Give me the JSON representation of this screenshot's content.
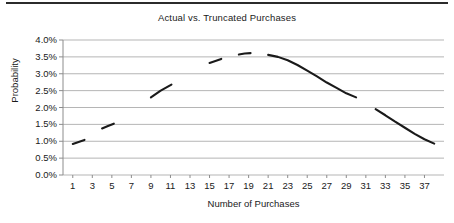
{
  "chart_data": {
    "type": "line",
    "title": "Actual vs. Truncated Purchases",
    "xlabel": "Number of Purchases",
    "ylabel": "Probability",
    "grid": true,
    "legend": "none",
    "xlim": [
      0,
      39
    ],
    "ylim": [
      0.0,
      4.0
    ],
    "ytick_values": [
      0.0,
      0.5,
      1.0,
      1.5,
      2.0,
      2.5,
      3.0,
      3.5,
      4.0
    ],
    "ytick_labels": [
      "0.0%",
      "0.5%",
      "1.0%",
      "1.5%",
      "2.0%",
      "2.5%",
      "3.0%",
      "3.5%",
      "4.0%"
    ],
    "xtick_values": [
      1,
      3,
      5,
      7,
      9,
      11,
      13,
      15,
      17,
      19,
      21,
      23,
      25,
      27,
      29,
      31,
      33,
      35,
      37
    ],
    "xtick_labels": [
      "1",
      "3",
      "5",
      "7",
      "9",
      "11",
      "13",
      "15",
      "17",
      "19",
      "21",
      "23",
      "25",
      "27",
      "29",
      "31",
      "33",
      "35",
      "37"
    ],
    "series": [
      {
        "name": "Probability",
        "color": "#1a1a1a",
        "style": "segmented-line",
        "segments": [
          {
            "x": [
              1.0,
              1.6,
              2.2
            ],
            "y": [
              0.92,
              0.98,
              1.04
            ]
          },
          {
            "x": [
              4.0,
              4.6,
              5.2
            ],
            "y": [
              1.38,
              1.45,
              1.52
            ]
          },
          {
            "x": [
              9.0,
              10.0,
              11.1
            ],
            "y": [
              2.3,
              2.5,
              2.68
            ]
          },
          {
            "x": [
              15.0,
              15.6,
              16.2
            ],
            "y": [
              3.32,
              3.38,
              3.44
            ]
          },
          {
            "x": [
              18.0,
              18.6,
              19.2
            ],
            "y": [
              3.57,
              3.6,
              3.61
            ]
          },
          {
            "x": [
              21.0,
              22.0,
              23.0,
              24.0,
              25.0,
              26.0,
              27.0,
              28.0,
              29.0,
              30.0
            ],
            "y": [
              3.56,
              3.5,
              3.4,
              3.26,
              3.09,
              2.92,
              2.74,
              2.58,
              2.42,
              2.3
            ]
          },
          {
            "x": [
              32.0,
              33.0,
              34.0,
              35.0,
              36.0,
              37.0,
              38.0
            ],
            "y": [
              1.95,
              1.77,
              1.58,
              1.4,
              1.22,
              1.06,
              0.93
            ]
          }
        ]
      }
    ]
  },
  "figure": {
    "top_rule": "horizontal-rule",
    "background_color": "#ffffff",
    "grid_color": "#b5b5b5",
    "axis_color": "#8c8c8c",
    "line_color": "#1a1a1a"
  }
}
